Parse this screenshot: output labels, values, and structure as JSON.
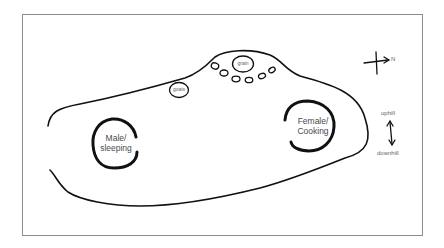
{
  "diagram": {
    "type": "hand-drawn site sketch map",
    "areas": {
      "male": {
        "line1": "Male/",
        "line2": "sleeping"
      },
      "female": {
        "line1": "Female/",
        "line2": "Cooking"
      },
      "goats": {
        "label": "goats"
      },
      "grain": {
        "label": "grain"
      }
    },
    "compass": {
      "label": "N"
    },
    "slope": {
      "up": "uphill",
      "down": "downhill"
    },
    "colors": {
      "stroke": "#111111",
      "frame": "#8c8c8c",
      "text": "#555555"
    }
  }
}
